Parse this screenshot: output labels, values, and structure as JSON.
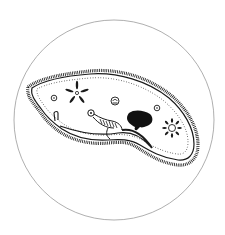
{
  "illustration": {
    "subject": "paramecium",
    "style": "black ink line drawing inside circular frame",
    "colors": {
      "background": "#ffffff",
      "ink": "#1a1a1a",
      "frame": "#9a9a9a"
    },
    "parts": [
      "circular-frame",
      "cell-body",
      "cilia",
      "pellicle-dots",
      "contractile-vacuole-anterior",
      "contractile-vacuole-posterior",
      "food-vacuoles",
      "macronucleus",
      "oral-groove",
      "gullet",
      "anal-pore"
    ]
  }
}
